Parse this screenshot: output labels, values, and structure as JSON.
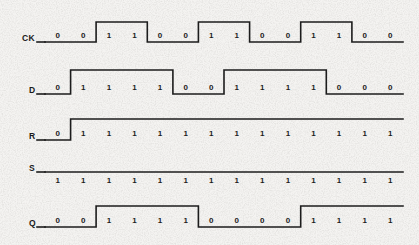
{
  "figure": {
    "type": "digital-timing-diagram",
    "background_color": "#f4f3f1",
    "trace_color": "#1c1c1c",
    "text_color": "#1a1a1a"
  },
  "chart_data": {
    "type": "line",
    "title": "",
    "xlabel": "",
    "ylabel": "",
    "subtype": "digital-timing-waveform",
    "time_slots": 14,
    "slot_width_px": 25.6,
    "x_start_px": 45,
    "x_end_px": 403,
    "grid": false,
    "legend": "none",
    "signals": [
      {
        "name": "CK",
        "label": "CK",
        "values": [
          0,
          0,
          1,
          1,
          0,
          0,
          1,
          1,
          0,
          0,
          1,
          1,
          0,
          0
        ],
        "digits_above_line": true,
        "baseline_y": 42,
        "high_y": 22,
        "constant": false
      },
      {
        "name": "D",
        "label": "D",
        "values": [
          0,
          1,
          1,
          1,
          1,
          0,
          0,
          1,
          1,
          1,
          1,
          0,
          0,
          0
        ],
        "digits_above_line": true,
        "baseline_y": 94,
        "high_y": 70,
        "constant": false
      },
      {
        "name": "R",
        "label": "R",
        "values": [
          0,
          1,
          1,
          1,
          1,
          1,
          1,
          1,
          1,
          1,
          1,
          1,
          1,
          1
        ],
        "digits_above_line": true,
        "baseline_y": 140,
        "high_y": 119,
        "constant": false
      },
      {
        "name": "S",
        "label": "S",
        "values": [
          1,
          1,
          1,
          1,
          1,
          1,
          1,
          1,
          1,
          1,
          1,
          1,
          1,
          1
        ],
        "digits_above_line": false,
        "baseline_y": 172,
        "high_y": 172,
        "constant": true
      },
      {
        "name": "Q",
        "label": "Q",
        "values": [
          0,
          0,
          1,
          1,
          1,
          1,
          0,
          0,
          0,
          0,
          1,
          1,
          1,
          1
        ],
        "digits_above_line": true,
        "baseline_y": 227,
        "high_y": 206,
        "constant": false
      }
    ]
  },
  "labels": {
    "ck": "CK",
    "d": "D",
    "r": "R",
    "s": "S",
    "q": "Q"
  }
}
